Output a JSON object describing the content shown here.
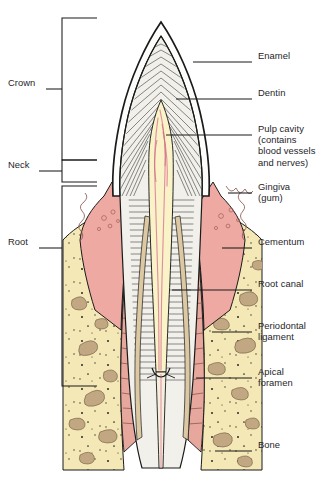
{
  "figure": {
    "background_color": "#ffffff",
    "outline_color": "#1a1a1a",
    "text_color": "#25252a"
  },
  "colors": {
    "enamel": "#fdfdfb",
    "dentin": "#f0efe9",
    "dentin_hatch": "#4a4a4a",
    "pulp": "#fbf3c8",
    "pulp_vessel": "#e08fa0",
    "gingiva": "#eeaaa2",
    "gingiva_dark": "#d78f88",
    "bone": "#f4e9b6",
    "bone_trabecula": "#c2a783",
    "periodontal_ligament": "#e8a79c",
    "cementum": "#dcc9a4",
    "root_canal": "#f6eedd",
    "leader_line": "#1a1a1a"
  },
  "labels_right": [
    {
      "id": "enamel",
      "text": "Enamel",
      "x": 258,
      "y": 55,
      "leader": {
        "x1": 193,
        "y1": 62,
        "x2": 252,
        "y2": 62
      }
    },
    {
      "id": "dentin",
      "text": "Dentin",
      "x": 258,
      "y": 92,
      "leader": {
        "x1": 176,
        "y1": 99,
        "x2": 252,
        "y2": 99
      }
    },
    {
      "id": "pulp-cavity",
      "text": "Pulp cavity\n(contains\nblood vessels\nand nerves)",
      "x": 258,
      "y": 128,
      "leader": {
        "x1": 166,
        "y1": 135,
        "x2": 252,
        "y2": 135
      }
    },
    {
      "id": "gingiva",
      "text": "Gingiva\n(gum)",
      "x": 258,
      "y": 186,
      "leader": {
        "x1": 228,
        "y1": 193,
        "x2": 252,
        "y2": 193
      }
    },
    {
      "id": "cementum",
      "text": "Cementum",
      "x": 258,
      "y": 241,
      "leader": {
        "x1": 222,
        "y1": 248,
        "x2": 252,
        "y2": 248
      }
    },
    {
      "id": "root-canal",
      "text": "Root canal",
      "x": 258,
      "y": 283,
      "leader": {
        "x1": 172,
        "y1": 290,
        "x2": 252,
        "y2": 290
      }
    },
    {
      "id": "periodontal-ligament",
      "text": "Periodontal\nligament",
      "x": 258,
      "y": 325,
      "leader": {
        "x1": 212,
        "y1": 332,
        "x2": 252,
        "y2": 332
      }
    },
    {
      "id": "apical-foramen",
      "text": "Apical\nforamen",
      "x": 258,
      "y": 382,
      "leader": {
        "x1": 196,
        "y1": 378,
        "x2": 252,
        "y2": 378
      }
    },
    {
      "id": "bone",
      "text": "Bone",
      "x": 258,
      "y": 444,
      "leader": {
        "x1": 215,
        "y1": 451,
        "x2": 252,
        "y2": 451
      }
    }
  ],
  "labels_left": [
    {
      "id": "crown",
      "text": "Crown",
      "x": 8,
      "y": 82,
      "leader": {
        "x1": 46,
        "y1": 89,
        "x2": 62,
        "y2": 89
      },
      "bracket": {
        "x": 62,
        "top": 18,
        "bottom": 160,
        "arm": 35
      }
    },
    {
      "id": "neck",
      "text": "Neck",
      "x": 8,
      "y": 164,
      "leader": {
        "x1": 39,
        "y1": 171,
        "x2": 62,
        "y2": 171
      },
      "bracket": {
        "x": 62,
        "top": 160,
        "bottom": 182,
        "arm": 35
      }
    },
    {
      "id": "root",
      "text": "Root",
      "x": 8,
      "y": 241,
      "leader": {
        "x1": 39,
        "y1": 248,
        "x2": 62,
        "y2": 248
      },
      "bracket": {
        "x": 62,
        "top": 186,
        "bottom": 386,
        "arm": 35
      }
    }
  ],
  "structures": [
    {
      "id": "enamel-layer",
      "name": "Enamel",
      "region": "crown-outer"
    },
    {
      "id": "dentin-layer",
      "name": "Dentin",
      "region": "crown-and-root-body"
    },
    {
      "id": "pulp-chamber",
      "name": "Pulp cavity",
      "region": "crown-center"
    },
    {
      "id": "gingiva-left",
      "name": "Gingiva (gum)",
      "region": "neck-left"
    },
    {
      "id": "gingiva-right",
      "name": "Gingiva (gum)",
      "region": "neck-right"
    },
    {
      "id": "cementum-layer",
      "name": "Cementum",
      "region": "root-surface"
    },
    {
      "id": "root-canal-channel",
      "name": "Root canal",
      "region": "root-center"
    },
    {
      "id": "pdl-left",
      "name": "Periodontal ligament",
      "region": "root-left"
    },
    {
      "id": "pdl-right",
      "name": "Periodontal ligament",
      "region": "root-right"
    },
    {
      "id": "apical-foramen-opening",
      "name": "Apical foramen",
      "region": "root-apex"
    },
    {
      "id": "alveolar-bone-left",
      "name": "Bone",
      "region": "socket-left"
    },
    {
      "id": "alveolar-bone-right",
      "name": "Bone",
      "region": "socket-right"
    }
  ]
}
